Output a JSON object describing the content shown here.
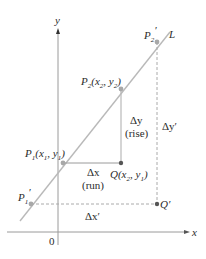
{
  "diagram": {
    "axes": {
      "x_label": "x",
      "y_label": "y",
      "origin_label": "0"
    },
    "line": {
      "label": "L",
      "color": "#b9b9b9"
    },
    "points": {
      "P2prime": {
        "name": "P",
        "sub": "2",
        "prime": "′"
      },
      "P2": {
        "name": "P",
        "sub": "2",
        "coords_open": "(x",
        "coords_sub1": "2",
        "coords_mid": ", y",
        "coords_sub2": "2",
        "coords_close": ")"
      },
      "P1": {
        "name": "P",
        "sub": "1",
        "coords_open": "(x",
        "coords_sub1": "1",
        "coords_mid": ", y",
        "coords_sub2": "1",
        "coords_close": ")"
      },
      "P1prime": {
        "name": "P",
        "sub": "1",
        "prime": "′"
      },
      "Q": {
        "name": "Q",
        "coords_open": "(x",
        "coords_sub1": "2",
        "coords_mid": ", y",
        "coords_sub2": "1",
        "coords_close": ")"
      },
      "Qprime": {
        "name": "Q′"
      }
    },
    "annotations": {
      "delta_y": "Δy",
      "rise": "(rise)",
      "delta_x": "Δx",
      "run": "(run)",
      "delta_y_prime": "Δy′",
      "delta_x_prime": "Δx′"
    },
    "colors": {
      "axis": "#9a9a9a",
      "line": "#b9b9b9",
      "point": "#a8a8a8",
      "dark_point": "#555555",
      "text": "#2b2b2b"
    }
  }
}
